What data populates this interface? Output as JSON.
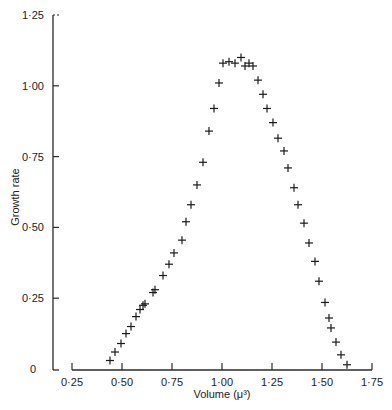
{
  "chart_data": {
    "type": "scatter",
    "title": "",
    "xlabel": "Volume (μ³)",
    "ylabel": "Growth rate",
    "xlim": [
      0.25,
      1.75
    ],
    "ylim": [
      0,
      1.25
    ],
    "x_ticks": [
      "0·25",
      "0·50",
      "0·75",
      "1·00",
      "1·25",
      "1·50",
      "1·75"
    ],
    "x_tick_values": [
      0.25,
      0.5,
      0.75,
      1.0,
      1.25,
      1.5,
      1.75
    ],
    "y_ticks": [
      "0",
      "0·25",
      "0·50",
      "0·75",
      "1·00",
      "1·25"
    ],
    "y_tick_values": [
      0,
      0.25,
      0.5,
      0.75,
      1.0,
      1.25
    ],
    "grid": false,
    "legend": null,
    "marker": "+",
    "series": [
      {
        "name": "Growth rate",
        "x": [
          0.44,
          0.465,
          0.495,
          0.52,
          0.545,
          0.57,
          0.59,
          0.605,
          0.615,
          0.655,
          0.665,
          0.705,
          0.735,
          0.76,
          0.8,
          0.82,
          0.845,
          0.875,
          0.905,
          0.935,
          0.96,
          0.985,
          1.005,
          1.035,
          1.065,
          1.095,
          1.115,
          1.135,
          1.155,
          1.18,
          1.205,
          1.225,
          1.255,
          1.28,
          1.31,
          1.33,
          1.36,
          1.38,
          1.41,
          1.435,
          1.465,
          1.485,
          1.515,
          1.535,
          1.545,
          1.57,
          1.595,
          1.625
        ],
        "y": [
          0.03,
          0.06,
          0.09,
          0.125,
          0.15,
          0.185,
          0.21,
          0.225,
          0.23,
          0.27,
          0.28,
          0.33,
          0.37,
          0.41,
          0.455,
          0.52,
          0.58,
          0.65,
          0.73,
          0.84,
          0.92,
          1.01,
          1.08,
          1.085,
          1.08,
          1.1,
          1.07,
          1.08,
          1.07,
          1.02,
          0.97,
          0.92,
          0.87,
          0.815,
          0.77,
          0.71,
          0.64,
          0.58,
          0.515,
          0.445,
          0.38,
          0.31,
          0.235,
          0.18,
          0.145,
          0.095,
          0.05,
          0.015
        ]
      }
    ]
  },
  "labels": {
    "xlabel": "Volume (μ³)",
    "ylabel": "Growth rate"
  }
}
